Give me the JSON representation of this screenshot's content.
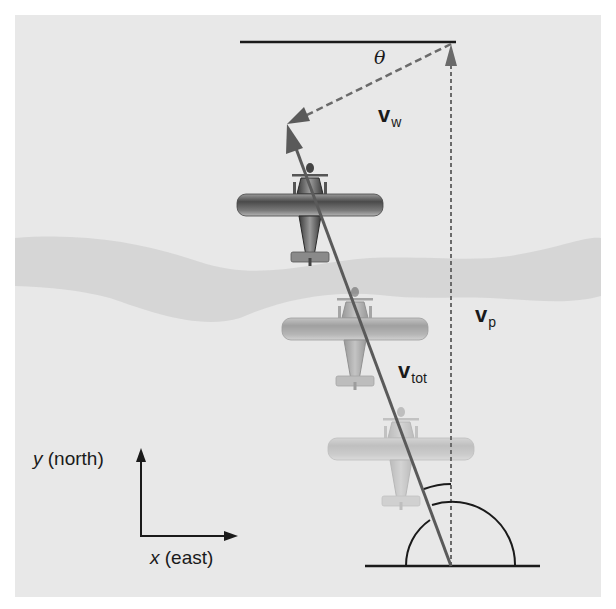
{
  "figure": {
    "background": "#e8e8e8",
    "river_color": "#d2d2d2",
    "line_color": "#1a1a1a",
    "vector_color": "#5a5a5a"
  },
  "labels": {
    "theta": "θ",
    "v_w": {
      "main": "v",
      "sub": "w"
    },
    "v_p": {
      "main": "v",
      "sub": "p"
    },
    "v_tot": {
      "main": "v",
      "sub": "tot"
    },
    "y_axis": {
      "var": "y",
      "text": " (north)"
    },
    "x_axis": {
      "var": "x",
      "text": " (east)"
    }
  },
  "vectors": [
    {
      "name": "v_p",
      "from": [
        451,
        566
      ],
      "to": [
        451,
        44
      ],
      "style": "dashed"
    },
    {
      "name": "v_w",
      "from": [
        451,
        44
      ],
      "to": [
        287,
        124
      ],
      "style": "dashed"
    },
    {
      "name": "v_tot",
      "from": [
        451,
        566
      ],
      "to": [
        287,
        124
      ],
      "style": "solid"
    }
  ],
  "planes": [
    {
      "position": "top",
      "opacity": 1.0
    },
    {
      "position": "middle",
      "opacity": 0.45
    },
    {
      "position": "bottom",
      "opacity": 0.25
    }
  ]
}
